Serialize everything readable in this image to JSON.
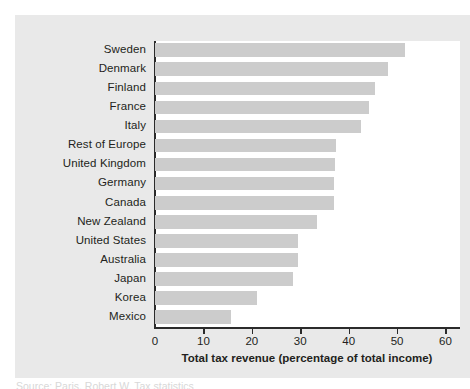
{
  "chart_data": {
    "type": "bar",
    "orientation": "horizontal",
    "title": "",
    "xlabel": "Total tax revenue (percentage of total income)",
    "ylabel": "",
    "xlim": [
      0,
      63
    ],
    "xticks": [
      0,
      10,
      20,
      30,
      40,
      50,
      60
    ],
    "xtick_labels": [
      "0",
      "10",
      "20",
      "30",
      "40",
      "50",
      "60"
    ],
    "grid": false,
    "legend": null,
    "bar_color": "#cccccc",
    "panel_color": "#e9e9e9",
    "plot_color": "#ffffff",
    "axis_color": "#2b2b2b",
    "categories": [
      "Sweden",
      "Denmark",
      "Finland",
      "France",
      "Italy",
      "Rest of Europe",
      "United Kingdom",
      "Germany",
      "Canada",
      "New Zealand",
      "United States",
      "Australia",
      "Japan",
      "Korea",
      "Mexico"
    ],
    "values": [
      51.7,
      48.1,
      45.4,
      44.2,
      42.5,
      37.3,
      37.1,
      37.0,
      37.0,
      33.5,
      29.6,
      29.6,
      28.6,
      21.0,
      15.8
    ]
  },
  "source": {
    "caption": "Source: Paris, Robert W. Tax statistics"
  }
}
